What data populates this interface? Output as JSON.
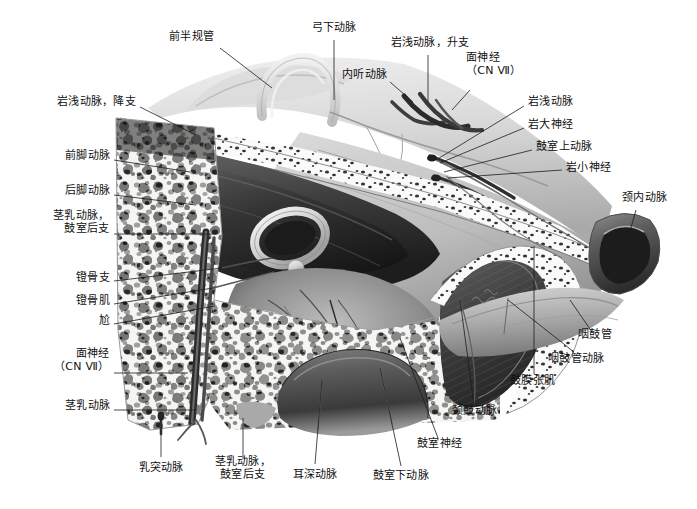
{
  "figure": {
    "kind": "grayscale-anatomical-illustration",
    "background_color": "#ffffff",
    "ink_color": "#101010",
    "leader_color": "#1c1c1c"
  },
  "labels": [
    {
      "id": "anterior-semicircular-canal",
      "text": "前半规管",
      "align": "right",
      "x": 214,
      "y": 36,
      "lead": [
        [
          220,
          48
        ],
        [
          272,
          88
        ]
      ]
    },
    {
      "id": "subarcuate-artery",
      "text": "弓下动脉",
      "align": "center",
      "x": 334,
      "y": 27,
      "lead": [
        [
          334,
          40
        ],
        [
          334,
          100
        ]
      ]
    },
    {
      "id": "petrosal-artery-ascending-branch",
      "text": "岩浅动脉，升支",
      "align": "center",
      "x": 430,
      "y": 42,
      "lead": [
        [
          428,
          55
        ],
        [
          428,
          102
        ]
      ]
    },
    {
      "id": "internal-auditory-artery",
      "text": "内听动脉",
      "align": "right",
      "x": 387,
      "y": 74,
      "lead": [
        [
          390,
          82
        ],
        [
          413,
          102
        ]
      ]
    },
    {
      "id": "facial-nerve-cn7-top",
      "text": "面神经\n（CN Ⅶ）",
      "align": "left",
      "x": 466,
      "y": 64,
      "lead": [
        [
          470,
          90
        ],
        [
          452,
          110
        ]
      ]
    },
    {
      "id": "petrosal-artery",
      "text": "岩浅动脉",
      "align": "left",
      "x": 528,
      "y": 101,
      "lead": [
        [
          524,
          106
        ],
        [
          436,
          160
        ]
      ]
    },
    {
      "id": "greater-petrosal-nerve",
      "text": "岩大神经",
      "align": "left",
      "x": 528,
      "y": 124,
      "lead": [
        [
          524,
          128
        ],
        [
          440,
          163
        ]
      ]
    },
    {
      "id": "superior-tympanic-artery",
      "text": "鼓室上动脉",
      "align": "left",
      "x": 536,
      "y": 146,
      "lead": [
        [
          532,
          150
        ],
        [
          444,
          172
        ]
      ]
    },
    {
      "id": "lesser-petrosal-nerve",
      "text": "岩小神经",
      "align": "left",
      "x": 566,
      "y": 167,
      "lead": [
        [
          562,
          170
        ],
        [
          448,
          178
        ]
      ]
    },
    {
      "id": "internal-carotid-artery",
      "text": "颈内动脉",
      "align": "left",
      "x": 622,
      "y": 197,
      "lead": [
        [
          636,
          210
        ],
        [
          628,
          238
        ]
      ]
    },
    {
      "id": "eustachian-tube",
      "text": "咽鼓管",
      "align": "left",
      "x": 578,
      "y": 334,
      "lead": [
        [
          592,
          332
        ],
        [
          570,
          300
        ]
      ]
    },
    {
      "id": "eustachian-tube-artery",
      "text": "咽鼓管动脉",
      "align": "left",
      "x": 548,
      "y": 358,
      "lead": [
        [
          574,
          352
        ],
        [
          508,
          300
        ]
      ]
    },
    {
      "id": "tensor-tympani",
      "text": "鼓膜张肌",
      "align": "left",
      "x": 510,
      "y": 380,
      "lead": [
        [
          534,
          374
        ],
        [
          534,
          246
        ]
      ]
    },
    {
      "id": "carotico-tympanic-artery",
      "text": "颈鼓动脉",
      "align": "left",
      "x": 452,
      "y": 410,
      "lead": [
        [
          474,
          404
        ],
        [
          460,
          300
        ]
      ]
    },
    {
      "id": "tympanic-nerve",
      "text": "鼓室神经",
      "align": "left",
      "x": 417,
      "y": 443,
      "lead": [
        [
          438,
          438
        ],
        [
          400,
          338
        ]
      ]
    },
    {
      "id": "inferior-tympanic-artery",
      "text": "鼓室下动脉",
      "align": "center",
      "x": 401,
      "y": 475,
      "lead": [
        [
          401,
          466
        ],
        [
          380,
          368
        ]
      ]
    },
    {
      "id": "deep-auricular-artery",
      "text": "耳深动脉",
      "align": "center",
      "x": 315,
      "y": 474,
      "lead": [
        [
          315,
          464
        ],
        [
          322,
          380
        ]
      ]
    },
    {
      "id": "stylomastoid-artery-post-tympanic-branch-bottom",
      "text": "茎乳动脉，\n鼓室后支",
      "align": "center",
      "x": 243,
      "y": 468,
      "lead": [
        [
          243,
          458
        ],
        [
          243,
          418
        ]
      ]
    },
    {
      "id": "mastoid-artery",
      "text": "乳突动脉",
      "align": "center",
      "x": 161,
      "y": 467,
      "lead": [
        [
          161,
          457
        ],
        [
          161,
          417
        ]
      ]
    },
    {
      "id": "stylomastoid-artery",
      "text": "茎乳动脉",
      "align": "right",
      "x": 110,
      "y": 405,
      "lead": [
        [
          114,
          410
        ],
        [
          196,
          410
        ]
      ]
    },
    {
      "id": "facial-nerve-cn7-left",
      "text": "面神经\n（CN Ⅶ）",
      "align": "right",
      "x": 110,
      "y": 360,
      "lead": [
        [
          114,
          373
        ],
        [
          188,
          373
        ]
      ]
    },
    {
      "id": "promontory",
      "text": "尬",
      "align": "right",
      "x": 110,
      "y": 320,
      "lead": [
        [
          114,
          324
        ],
        [
          215,
          306
        ]
      ]
    },
    {
      "id": "stapedius-muscle",
      "text": "镫骨肌",
      "align": "right",
      "x": 110,
      "y": 300,
      "lead": [
        [
          114,
          304
        ],
        [
          213,
          288
        ]
      ]
    },
    {
      "id": "stapedial-branch",
      "text": "镫骨支",
      "align": "right",
      "x": 110,
      "y": 277,
      "lead": [
        [
          114,
          281
        ],
        [
          222,
          268
        ]
      ]
    },
    {
      "id": "stylomastoid-artery-post-tympanic-branch-left",
      "text": "茎乳动脉，\n鼓室后支",
      "align": "right",
      "x": 110,
      "y": 222,
      "lead": [
        [
          114,
          234
        ],
        [
          215,
          234
        ]
      ]
    },
    {
      "id": "posterior-crural-artery",
      "text": "后脚动脉",
      "align": "right",
      "x": 110,
      "y": 190,
      "lead": [
        [
          114,
          195
        ],
        [
          196,
          205
        ]
      ]
    },
    {
      "id": "anterior-crural-artery",
      "text": "前脚动脉",
      "align": "right",
      "x": 110,
      "y": 155,
      "lead": [
        [
          114,
          160
        ],
        [
          190,
          172
        ]
      ]
    },
    {
      "id": "petrosal-artery-descending-branch",
      "text": "岩浅动脉，降支",
      "align": "right",
      "x": 136,
      "y": 101,
      "lead": [
        [
          140,
          107
        ],
        [
          196,
          135
        ]
      ]
    }
  ]
}
